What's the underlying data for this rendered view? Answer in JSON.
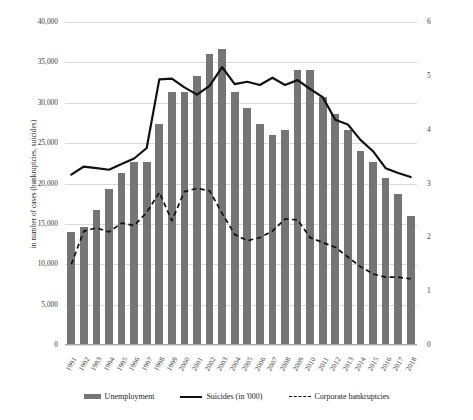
{
  "chart_data": {
    "type": "bar",
    "title": "",
    "xlabel": "",
    "ylabel": "in number of cases (bankruptcies, suicides)",
    "y2label": "in percent (unemployment)",
    "ylim": [
      0,
      40000
    ],
    "y2lim": [
      0,
      6
    ],
    "grid": true,
    "legend_position": "bottom",
    "categories": [
      "1991",
      "1992",
      "1993",
      "1994",
      "1995",
      "1996",
      "1997",
      "1998",
      "1999",
      "2000",
      "2001",
      "2002",
      "2003",
      "2004",
      "2005",
      "2006",
      "2007",
      "2008",
      "2009",
      "2010",
      "2011",
      "2012",
      "2013",
      "2014",
      "2015",
      "2016",
      "2017",
      "2018"
    ],
    "series": [
      {
        "name": "Unemployment",
        "type": "bar",
        "axis": "right",
        "unit": "percent",
        "values": [
          2.1,
          2.2,
          2.5,
          2.9,
          3.2,
          3.4,
          3.4,
          4.1,
          4.7,
          4.7,
          5.0,
          5.4,
          5.5,
          4.7,
          4.4,
          4.1,
          3.9,
          4.0,
          5.1,
          5.1,
          4.6,
          4.3,
          4.0,
          3.6,
          3.4,
          3.1,
          2.8,
          2.4
        ]
      },
      {
        "name": "Suicides (in '000)",
        "type": "line",
        "style": "solid",
        "axis": "left",
        "values": [
          21100,
          22100,
          21900,
          21700,
          22400,
          23100,
          24400,
          32900,
          33000,
          31900,
          31000,
          32100,
          34400,
          32300,
          32600,
          32200,
          33100,
          32200,
          32800,
          31700,
          30700,
          27900,
          27300,
          25400,
          24000,
          21900,
          21300,
          20800
        ]
      },
      {
        "name": "Corporate bankruptcies",
        "type": "line",
        "style": "dashed",
        "axis": "left",
        "values": [
          10000,
          14100,
          14500,
          14000,
          15100,
          14800,
          16400,
          18900,
          15400,
          19000,
          19400,
          19100,
          16300,
          13700,
          12900,
          13300,
          14100,
          15600,
          15500,
          13300,
          12700,
          12100,
          10900,
          9700,
          8800,
          8400,
          8400,
          8200
        ]
      }
    ]
  },
  "axes": {
    "left_ticks": [
      "40,000",
      "35,000",
      "30,000",
      "25,000",
      "20,000",
      "15,000",
      "10,000",
      "5,000",
      "0"
    ],
    "right_ticks": [
      "6",
      "5",
      "4",
      "3",
      "2",
      "1",
      "0"
    ]
  },
  "legend": {
    "items": [
      {
        "label": "Unemployment",
        "marker": "bar-swatch",
        "color": "#757575"
      },
      {
        "label": "Suicides (in '000)",
        "marker": "solid-line-swatch",
        "color": "#111111"
      },
      {
        "label": "Corporate bankruptcies",
        "marker": "dashed-line-swatch",
        "color": "#111111"
      }
    ]
  }
}
